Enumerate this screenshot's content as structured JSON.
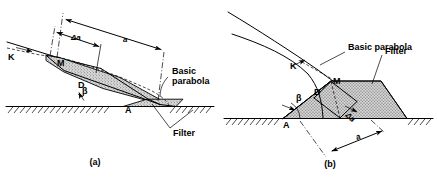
{
  "figure": {
    "panels": [
      {
        "id": "a",
        "caption": "(a)",
        "labels": {
          "point_k": "K",
          "point_m": "M",
          "point_d": "D",
          "point_a": "A",
          "angle_beta": "β",
          "dim_a": "a",
          "dim_delta_a": "Δa",
          "basic_parabola_line1": "Basic",
          "basic_parabola_line2": "parabola",
          "filter": "Filter"
        }
      },
      {
        "id": "b",
        "caption": "(b)",
        "labels": {
          "point_k": "K",
          "point_m": "M",
          "point_d": "D",
          "point_a": "A",
          "angle_beta": "β",
          "dim_a": "a",
          "dim_delta_a": "Δa",
          "basic_parabola": "Basic parabola",
          "filter": "Filter"
        }
      }
    ],
    "colors": {
      "stroke": "#000000",
      "background": "#ffffff",
      "filter_fill": "#cfcfcf",
      "ground_line": "#000000"
    }
  }
}
